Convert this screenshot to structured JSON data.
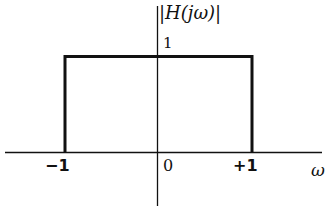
{
  "title": "|H(jω)|",
  "y_axis_label": "|H(jω)|",
  "x_axis_label": "ω",
  "ticks": {
    "left": "−1",
    "origin": "0",
    "right": "+1",
    "height": "1"
  },
  "colors": {
    "line": "#111111",
    "background": "#ffffff"
  },
  "shape": {
    "type": "rectangular-pulse",
    "from": -1,
    "to": 1,
    "height": 1
  }
}
